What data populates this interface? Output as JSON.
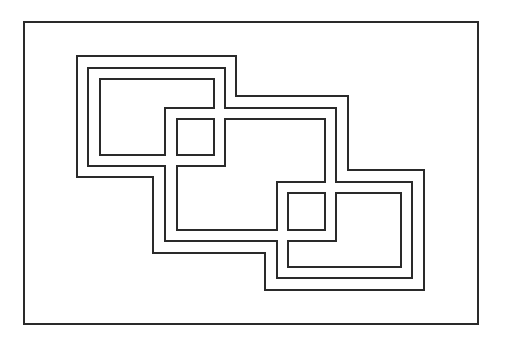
{
  "canvas": {
    "width": 509,
    "height": 346,
    "background": "#ffffff",
    "stroke_color": "#2a2a2a"
  },
  "diagram": {
    "frame": {
      "x": 24,
      "y": 22,
      "width": 454,
      "height": 302
    },
    "shapes": [
      {
        "name": "outer-band-outline",
        "points": "77,56 236,56 236,96 348,96 348,170 424,170 424,290 265,290 265,253 153,253 153,177 77,177"
      },
      {
        "name": "middle-band-outline",
        "points": "88,68 225,68 225,108 336,108 336,182 412,182 412,278 277,278 277,241 165,241 165,166 88,166"
      },
      {
        "name": "top-left-inner-room",
        "points": "100,79 214,79 214,108 165,108 165,155 100,155"
      },
      {
        "name": "top-left-small-square",
        "points": "177,119 214,119 214,155 177,155"
      },
      {
        "name": "center-room",
        "points": "225,119 325,119 325,182 277,182 277,230 177,230 177,166 225,166"
      },
      {
        "name": "bottom-right-small-square",
        "points": "288,193 325,193 325,230 288,230"
      },
      {
        "name": "bottom-right-inner-room",
        "points": "336,193 401,193 401,267 288,267 288,241 336,241"
      }
    ]
  }
}
